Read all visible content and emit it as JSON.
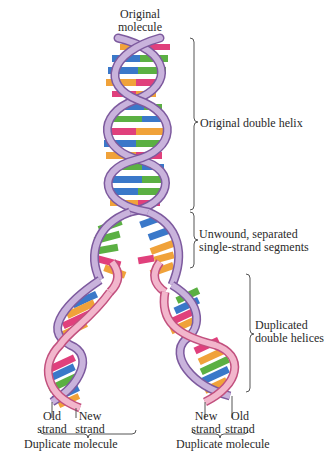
{
  "figure": {
    "labels": {
      "original_molecule": [
        "Original",
        "molecule"
      ],
      "original_double_helix": "Original double helix",
      "unwound_segments": [
        "Unwound, separated",
        "single-strand segments"
      ],
      "duplicated_helices": [
        "Duplicated",
        "double helices"
      ],
      "left_old_strand": [
        "Old",
        "strand"
      ],
      "left_new_strand": [
        "New",
        "strand"
      ],
      "left_duplicate": "Duplicate molecule",
      "right_new_strand": [
        "New",
        "strand"
      ],
      "right_old_strand": [
        "Old",
        "strand"
      ],
      "right_duplicate": "Duplicate molecule"
    },
    "colors": {
      "old_strand": "#c9b3dc",
      "old_strand_edge": "#7d5a9e",
      "new_strand": "#f2b6cc",
      "new_strand_edge": "#c2507e",
      "base_A": "#f0a23a",
      "base_T": "#e0407c",
      "base_G": "#5bb043",
      "base_C": "#3a78c9",
      "bracket": "#555555"
    },
    "base_pairs_top": [
      "T-A",
      "C-G",
      "C-G",
      "A-T",
      "T-A",
      "C-G",
      "G-C",
      "A-T",
      "T-A",
      "C-G",
      "G-C",
      "C-G",
      "A-T"
    ]
  }
}
